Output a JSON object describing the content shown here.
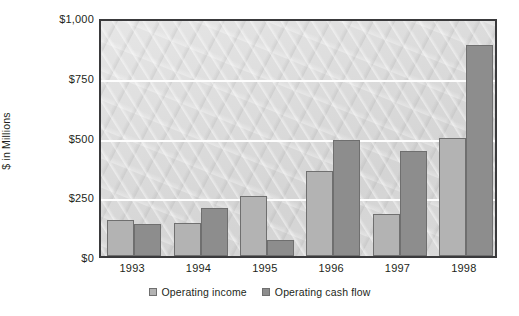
{
  "chart_data": {
    "type": "bar",
    "title": "",
    "subtitle": "",
    "xlabel": "",
    "ylabel": "$ in Millions",
    "categories": [
      "1993",
      "1994",
      "1995",
      "1996",
      "1997",
      "1998"
    ],
    "series": [
      {
        "name": "Operating income",
        "color": "#b3b3b3",
        "values": [
          150,
          140,
          250,
          355,
          175,
          495
        ]
      },
      {
        "name": "Operating cash flow",
        "color": "#8d8d8d",
        "values": [
          133,
          200,
          65,
          485,
          440,
          885
        ]
      }
    ],
    "ylim": [
      0,
      1000
    ],
    "y_ticks": [
      0,
      250,
      500,
      750,
      1000
    ],
    "y_tick_labels": [
      "$0",
      "$250",
      "$500",
      "$750",
      "$1,000"
    ],
    "grid": true,
    "grid_color": "#fdfdfd",
    "legend_position": "bottom",
    "plot_background": "#dcdcdc",
    "border_color": "#3a3a3c"
  }
}
